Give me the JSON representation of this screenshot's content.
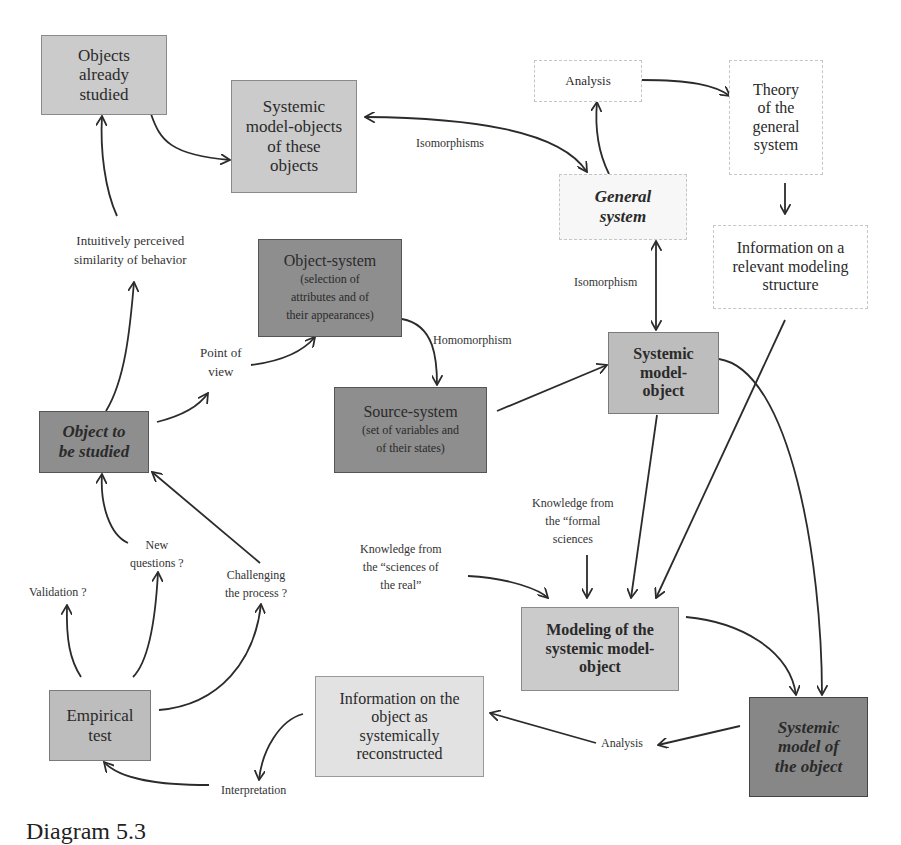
{
  "diagram": {
    "boxes": {
      "objects_already_studied": {
        "lines": [
          "Objects",
          "already",
          "studied"
        ]
      },
      "systemic_model_objects": {
        "lines": [
          "Systemic",
          "model-objects",
          "of these",
          "objects"
        ]
      },
      "analysis_top": {
        "lines": [
          "Analysis"
        ]
      },
      "theory_general_system": {
        "lines": [
          "Theory",
          "of the",
          "general",
          "system"
        ]
      },
      "general_system": {
        "lines": [
          "General",
          "system"
        ]
      },
      "info_modeling_structure": {
        "lines": [
          "Information on a",
          "relevant modeling",
          "structure"
        ]
      },
      "object_system": {
        "title": "Object-system",
        "lines": [
          "(selection of",
          "attributes and of",
          "their appearances)"
        ]
      },
      "source_system": {
        "title": "Source-system",
        "lines": [
          "(set of variables and",
          "of their states)"
        ]
      },
      "systemic_model_object": {
        "lines": [
          "Systemic",
          "model-",
          "object"
        ]
      },
      "object_to_be_studied": {
        "lines": [
          "Object to",
          "be studied"
        ]
      },
      "modeling_systemic_model_object": {
        "lines": [
          "Modeling of the",
          "systemic model-",
          "object"
        ]
      },
      "empirical_test": {
        "lines": [
          "Empirical",
          "test"
        ]
      },
      "info_object_reconstructed": {
        "lines": [
          "Information on the",
          "object as",
          "systemically",
          "reconstructed"
        ]
      },
      "systemic_model_of_object": {
        "lines": [
          "Systemic",
          "model of",
          "the object"
        ]
      }
    },
    "labels": {
      "isomorphisms": "Isomorphisms",
      "isomorphism": "Isomorphism",
      "homomorphism": "Homomorphism",
      "intuitive_similarity": [
        "Intuitively perceived",
        "similarity of behavior"
      ],
      "point_of_view": [
        "Point of",
        "view"
      ],
      "knowledge_formal": [
        "Knowledge from",
        "the “formal",
        "sciences"
      ],
      "knowledge_real": [
        "Knowledge from",
        "the “sciences of",
        "the real”"
      ],
      "new_questions": [
        "New",
        "questions ?"
      ],
      "validation": "Validation ?",
      "challenging": [
        "Challenging",
        "the process ?"
      ],
      "analysis_bottom": "Analysis",
      "interpretation": "Interpretation"
    },
    "caption": "Diagram 5.3"
  }
}
